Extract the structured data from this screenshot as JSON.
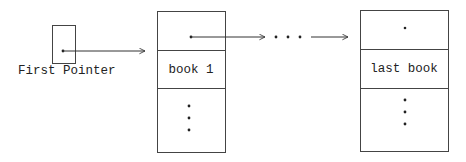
{
  "diagram": {
    "type": "linked-list",
    "pointer_label": "First Pointer",
    "ellipsis": "· · ·",
    "nodes": [
      {
        "id": "node-first",
        "label": "book 1",
        "continuation": "⋮"
      },
      {
        "id": "node-last",
        "label": "last book",
        "continuation": "⋮",
        "next": "null"
      }
    ],
    "colors": {
      "line": "#333333",
      "background": "#ffffff",
      "text": "#222222"
    }
  }
}
